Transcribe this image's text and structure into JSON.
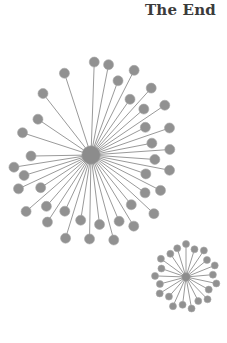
{
  "page": {
    "width": 227,
    "height": 343,
    "background_color": "#ffffff"
  },
  "header": {
    "title": "The End",
    "title_color": "#3b3b3b",
    "align": "right"
  },
  "palette": {
    "node_fill": "#919191",
    "node_stroke": "#a8a8a8",
    "edge_stroke": "#9a9a9a",
    "hub_fill": "#8c8c8c"
  },
  "chart_data": {
    "type": "scatter",
    "title": "The End",
    "xlabel": "",
    "ylabel": "",
    "xlim": [
      0,
      227
    ],
    "ylim": [
      0,
      343
    ],
    "grid": false,
    "legend": "none",
    "series": [
      {
        "name": "large-star-graph",
        "hub": {
          "x": 91,
          "y": 155,
          "r": 9.2
        },
        "node_radius": 5.0,
        "edge_width": 1.0,
        "leaf_count": 39,
        "leaves": [
          {
            "angle": 272,
            "radius": 93
          },
          {
            "angle": 281,
            "radius": 92
          },
          {
            "angle": 290,
            "radius": 79
          },
          {
            "angle": 297,
            "radius": 95
          },
          {
            "angle": 305,
            "radius": 68
          },
          {
            "angle": 312,
            "radius": 90
          },
          {
            "angle": 319,
            "radius": 70
          },
          {
            "angle": 326,
            "radius": 89
          },
          {
            "angle": 333,
            "radius": 61
          },
          {
            "angle": 341,
            "radius": 83
          },
          {
            "angle": 349,
            "radius": 62
          },
          {
            "angle": 356,
            "radius": 79
          },
          {
            "angle": 4,
            "radius": 64
          },
          {
            "angle": 11,
            "radius": 80
          },
          {
            "angle": 19,
            "radius": 58
          },
          {
            "angle": 27,
            "radius": 78
          },
          {
            "angle": 35,
            "radius": 66
          },
          {
            "angle": 43,
            "radius": 86
          },
          {
            "angle": 51,
            "radius": 64
          },
          {
            "angle": 59,
            "radius": 83
          },
          {
            "angle": 67,
            "radius": 72
          },
          {
            "angle": 75,
            "radius": 88
          },
          {
            "angle": 83,
            "radius": 70
          },
          {
            "angle": 91,
            "radius": 84
          },
          {
            "angle": 99,
            "radius": 66
          },
          {
            "angle": 107,
            "radius": 87
          },
          {
            "angle": 115,
            "radius": 62
          },
          {
            "angle": 123,
            "radius": 80
          },
          {
            "angle": 131,
            "radius": 68
          },
          {
            "angle": 139,
            "radius": 86
          },
          {
            "angle": 147,
            "radius": 60
          },
          {
            "angle": 155,
            "radius": 80
          },
          {
            "angle": 163,
            "radius": 70
          },
          {
            "angle": 171,
            "radius": 78
          },
          {
            "angle": 179,
            "radius": 60
          },
          {
            "angle": 198,
            "radius": 72
          },
          {
            "angle": 214,
            "radius": 64
          },
          {
            "angle": 232,
            "radius": 78
          },
          {
            "angle": 252,
            "radius": 86
          }
        ]
      },
      {
        "name": "small-star-graph",
        "hub": {
          "x": 186,
          "y": 277,
          "r": 4.2
        },
        "node_radius": 3.5,
        "edge_width": 0.9,
        "leaf_count": 21,
        "leaves": [
          {
            "angle": 270,
            "radius": 33
          },
          {
            "angle": 287,
            "radius": 29
          },
          {
            "angle": 304,
            "radius": 32
          },
          {
            "angle": 321,
            "radius": 27
          },
          {
            "angle": 338,
            "radius": 31
          },
          {
            "angle": 355,
            "radius": 27
          },
          {
            "angle": 12,
            "radius": 31
          },
          {
            "angle": 29,
            "radius": 26
          },
          {
            "angle": 46,
            "radius": 31
          },
          {
            "angle": 63,
            "radius": 27
          },
          {
            "angle": 80,
            "radius": 32
          },
          {
            "angle": 97,
            "radius": 28
          },
          {
            "angle": 114,
            "radius": 32
          },
          {
            "angle": 131,
            "radius": 26
          },
          {
            "angle": 148,
            "radius": 31
          },
          {
            "angle": 165,
            "radius": 27
          },
          {
            "angle": 182,
            "radius": 31
          },
          {
            "angle": 199,
            "radius": 26
          },
          {
            "angle": 216,
            "radius": 31
          },
          {
            "angle": 236,
            "radius": 28
          },
          {
            "angle": 253,
            "radius": 30
          }
        ]
      }
    ]
  }
}
